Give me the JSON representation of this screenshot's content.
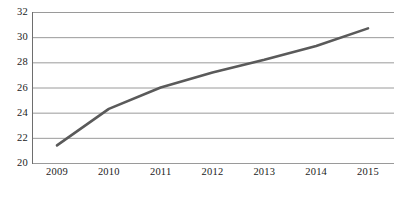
{
  "chart_data": {
    "type": "line",
    "title": "",
    "subtitle": "",
    "xlabel": "",
    "ylabel": "",
    "x": [
      "2009",
      "2010",
      "2011",
      "2012",
      "2013",
      "2014",
      "2015"
    ],
    "categories": [
      "2009",
      "2010",
      "2011",
      "2012",
      "2013",
      "2014",
      "2015"
    ],
    "values": [
      21.4,
      24.3,
      26.0,
      27.2,
      28.2,
      29.3,
      30.7
    ],
    "series": [
      {
        "name": "series-1",
        "values": [
          21.4,
          24.3,
          26.0,
          27.2,
          28.2,
          29.3,
          30.7
        ],
        "color": "#5a5a5a"
      }
    ],
    "ylim": [
      20,
      32
    ],
    "yticks": [
      20,
      22,
      24,
      26,
      28,
      30,
      32
    ],
    "ytick_labels": [
      "20",
      "22",
      "24",
      "26",
      "28",
      "30",
      "32"
    ],
    "xtick_labels": [
      "2009",
      "2010",
      "2011",
      "2012",
      "2013",
      "2014",
      "2015"
    ],
    "grid": "horizontal",
    "legend": "none",
    "line_color": "#5a5a5a",
    "grid_color": "#9a9a9a",
    "axis_color": "#6e6e6e",
    "background": "#ffffff"
  },
  "caption": {
    "text": ""
  }
}
